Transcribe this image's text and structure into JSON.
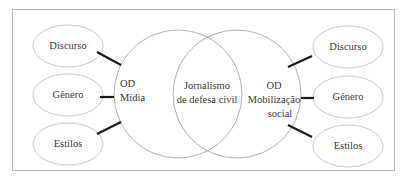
{
  "diagram": {
    "left_circle": {
      "title": "OD",
      "subtitle": "Mídia"
    },
    "right_circle": {
      "title": "OD",
      "subtitle": "Mobilização",
      "subtitle2": "social"
    },
    "intersection": {
      "line1": "Jornalismo",
      "line2": "de defesa civil"
    },
    "left_nodes": [
      {
        "label": "Discurso"
      },
      {
        "label": "Gênero"
      },
      {
        "label": "Estilos"
      }
    ],
    "right_nodes": [
      {
        "label": "Discurso"
      },
      {
        "label": "Gênero"
      },
      {
        "label": "Estilos"
      }
    ]
  }
}
